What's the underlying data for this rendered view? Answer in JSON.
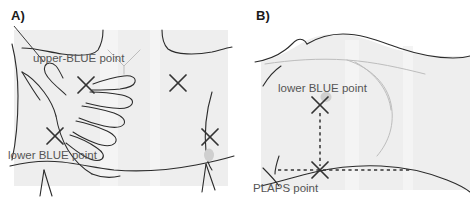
{
  "figure": {
    "type": "anatomical-diagram",
    "width": 470,
    "height": 208,
    "background_color": "#ffffff"
  },
  "panels": [
    {
      "id": "A",
      "label": "A)",
      "view": "anterior-chest",
      "annotations": [
        {
          "id": "upper-blue-point",
          "text": "upper-BLUE point",
          "x": 33,
          "y": 62
        },
        {
          "id": "lower-blue-point",
          "text": "lower BLUE point",
          "x": 8,
          "y": 159
        }
      ],
      "markers": [
        {
          "id": "x-upper-blue-left",
          "shape": "x",
          "x": 86,
          "y": 85
        },
        {
          "id": "x-upper-blue-right",
          "shape": "x",
          "x": 178,
          "y": 83
        },
        {
          "id": "x-lower-blue-left",
          "shape": "x",
          "x": 55,
          "y": 136
        },
        {
          "id": "x-lower-blue-right",
          "shape": "x",
          "x": 210,
          "y": 137
        }
      ]
    },
    {
      "id": "B",
      "label": "B)",
      "view": "lateral-chest",
      "annotations": [
        {
          "id": "lower-blue-point",
          "text": "lower BLUE point",
          "x": 43,
          "y": 92
        },
        {
          "id": "plaps-point",
          "text": "PLAPS point",
          "x": 18,
          "y": 192
        }
      ],
      "markers": [
        {
          "id": "x-lower-blue",
          "shape": "x",
          "x": 85,
          "y": 105
        },
        {
          "id": "x-plaps",
          "shape": "x",
          "x": 85,
          "y": 170
        }
      ],
      "guides": [
        {
          "id": "vertical-dashed-guide",
          "orientation": "vertical",
          "x": 85,
          "y1": 113,
          "y2": 166
        },
        {
          "id": "horizontal-dashed-guide",
          "orientation": "horizontal",
          "y": 170,
          "x1": 43,
          "x2": 175
        }
      ]
    }
  ],
  "colors": {
    "skin_fill": "#eeeeee",
    "skin_shadow": "#e4e4e4",
    "outline": "#2b2b2b",
    "annotation_text": "#555555",
    "marker": "#333333",
    "nipple": "#cfcfcf"
  }
}
